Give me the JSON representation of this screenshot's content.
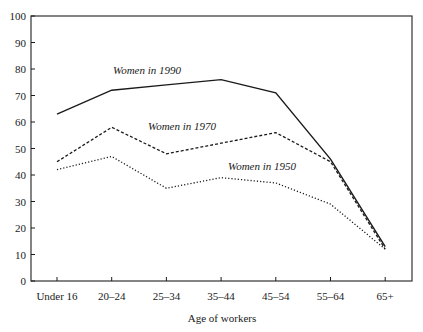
{
  "chart_data": {
    "type": "line",
    "title": "",
    "xlabel": "Age of workers",
    "ylabel": "",
    "ylim": [
      0,
      100
    ],
    "yticks": [
      0,
      10,
      20,
      30,
      40,
      50,
      60,
      70,
      80,
      90,
      100
    ],
    "grid": false,
    "legend": "inline labels",
    "categories": [
      "Under 16",
      "20–24",
      "25–34",
      "35–44",
      "45–54",
      "55–64",
      "65+"
    ],
    "series": [
      {
        "name": "Women in 1990",
        "style": "solid",
        "values": [
          63,
          72,
          74,
          76,
          71,
          46,
          13
        ],
        "label_pos": {
          "x": 113,
          "y": 74
        }
      },
      {
        "name": "Women in 1970",
        "style": "dashed",
        "values": [
          45,
          58,
          48,
          52,
          56,
          45,
          12
        ],
        "label_pos": {
          "x": 148,
          "y": 130
        }
      },
      {
        "name": "Women in 1950",
        "style": "dotted",
        "values": [
          42,
          47,
          35,
          39,
          37,
          29,
          12
        ],
        "label_pos": {
          "x": 228,
          "y": 170
        }
      }
    ]
  },
  "colors": {
    "line": "#1a1a1a",
    "frame": "#333333",
    "background": "#ffffff"
  }
}
